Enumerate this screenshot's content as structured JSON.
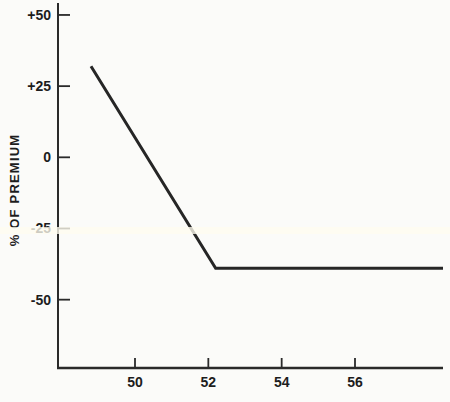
{
  "chart_data": {
    "type": "line",
    "title": "",
    "xlabel": "",
    "ylabel": "% OF PREMIUM",
    "x_ticks": [
      {
        "value": 50,
        "label": "50"
      },
      {
        "value": 52,
        "label": "52"
      },
      {
        "value": 54,
        "label": "54"
      },
      {
        "value": 56,
        "label": "56"
      }
    ],
    "y_ticks": [
      {
        "value": 50,
        "label": "+50"
      },
      {
        "value": 25,
        "label": "+25"
      },
      {
        "value": 0,
        "label": "0"
      },
      {
        "value": -25,
        "label": "-25"
      },
      {
        "value": -50,
        "label": "-50"
      }
    ],
    "xlim": [
      47.9,
      58.4
    ],
    "ylim": [
      -74,
      54.2
    ],
    "grid": false,
    "legend": false,
    "series": [
      {
        "name": "premium-percentage",
        "points": [
          [
            48.8,
            32
          ],
          [
            52.2,
            -39
          ],
          [
            58.4,
            -39
          ]
        ]
      }
    ],
    "colors": {
      "line": "#262626",
      "axis": "#2a2a2a",
      "tick_text": "#1d1d1d",
      "background": "#fbfbf9",
      "scan_stripe": "#fffdf0"
    }
  }
}
